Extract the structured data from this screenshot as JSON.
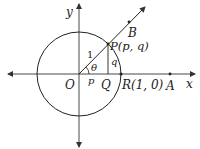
{
  "diagram": {
    "type": "unit-circle",
    "colors": {
      "stroke": "#222222",
      "axis": "#333333",
      "text": "#222222"
    },
    "labels": {
      "x_axis": "x",
      "y_axis": "y",
      "origin": "O",
      "point_P": "P(p, q)",
      "point_Q": "Q",
      "point_R": "R(1, 0)",
      "point_A": "A",
      "point_B": "B",
      "radius": "1",
      "angle": "θ",
      "adjacent": "p",
      "opposite": "q"
    }
  }
}
